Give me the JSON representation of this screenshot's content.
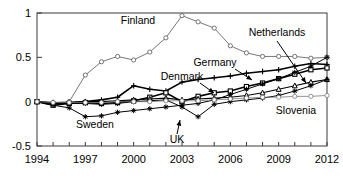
{
  "chart_data": {
    "type": "line",
    "title": "",
    "xlabel": "",
    "ylabel": "",
    "xlim": [
      1994,
      2012
    ],
    "ylim": [
      -0.5,
      1.0
    ],
    "yticks": [
      -0.5,
      0,
      0.5,
      1
    ],
    "ytick_labels": [
      "-0.5",
      "0",
      "0.5",
      "1"
    ],
    "xticks": [
      1994,
      1995,
      1996,
      1997,
      1998,
      1999,
      2000,
      2001,
      2002,
      2003,
      2004,
      2005,
      2006,
      2007,
      2008,
      2009,
      2010,
      2011,
      2012
    ],
    "xtick_labels_shown": [
      "1994",
      "1997",
      "2000",
      "2003",
      "2006",
      "2009",
      "2012"
    ],
    "xtick_label_years": [
      1994,
      1997,
      2000,
      2003,
      2006,
      2009,
      2012
    ],
    "grid": false,
    "legend": "inline-annotations",
    "x": [
      1994,
      1995,
      1996,
      1997,
      1998,
      1999,
      2000,
      2001,
      2002,
      2003,
      2004,
      2005,
      2006,
      2007,
      2008,
      2009,
      2010,
      2011,
      2012
    ],
    "series": [
      {
        "name": "Finland",
        "marker": "circle",
        "color": "#555555",
        "linewidth": 0.8,
        "values": [
          0.0,
          -0.01,
          0.0,
          0.3,
          0.45,
          0.51,
          0.47,
          0.56,
          0.72,
          0.97,
          0.9,
          0.83,
          0.63,
          0.55,
          0.51,
          0.51,
          0.51,
          0.49,
          0.5
        ]
      },
      {
        "name": "Germany",
        "marker": "plus",
        "color": "#000000",
        "linewidth": 1.6,
        "values": [
          0.0,
          -0.02,
          -0.01,
          0.0,
          0.02,
          0.05,
          0.18,
          0.14,
          0.12,
          0.22,
          0.25,
          0.27,
          0.29,
          0.32,
          0.34,
          0.36,
          0.4,
          0.43,
          0.42
        ]
      },
      {
        "name": "Denmark",
        "marker": "square",
        "color": "#000000",
        "linewidth": 1.6,
        "values": [
          0.0,
          -0.04,
          -0.02,
          -0.01,
          -0.02,
          -0.01,
          0.01,
          0.05,
          0.1,
          0.0,
          0.06,
          0.1,
          0.12,
          0.17,
          0.21,
          0.26,
          0.31,
          0.36,
          0.38
        ]
      },
      {
        "name": "Netherlands",
        "marker": "triangle",
        "color": "#000000",
        "linewidth": 1.1,
        "values": [
          0.0,
          -0.01,
          -0.01,
          0.0,
          0.0,
          0.01,
          0.02,
          0.03,
          0.04,
          0.02,
          0.03,
          0.04,
          0.05,
          0.07,
          0.1,
          0.14,
          0.18,
          0.22,
          0.25
        ]
      },
      {
        "name": "Sweden",
        "marker": "star",
        "color": "#000000",
        "linewidth": 1.0,
        "values": [
          0.0,
          -0.04,
          -0.07,
          -0.17,
          -0.16,
          -0.12,
          -0.1,
          -0.08,
          -0.06,
          -0.04,
          -0.02,
          0.02,
          0.08,
          0.14,
          0.2,
          0.26,
          0.33,
          0.4,
          0.5
        ]
      },
      {
        "name": "UK",
        "marker": "star",
        "color": "#000000",
        "linewidth": 1.0,
        "values": [
          0.0,
          -0.02,
          -0.02,
          -0.02,
          -0.03,
          -0.02,
          0.0,
          0.01,
          0.02,
          -0.06,
          -0.17,
          -0.03,
          0.0,
          0.02,
          0.04,
          0.07,
          0.12,
          0.18,
          0.25
        ]
      },
      {
        "name": "Slovenia",
        "marker": "circle",
        "color": "#777777",
        "linewidth": 0.8,
        "values": [
          0.0,
          -0.01,
          -0.01,
          -0.01,
          -0.01,
          0.0,
          0.0,
          0.0,
          0.01,
          0.01,
          0.01,
          0.02,
          0.03,
          0.04,
          0.05,
          0.05,
          0.06,
          0.06,
          0.07
        ]
      }
    ],
    "annotations": [
      {
        "label": "Finland",
        "x": 138,
        "y": 24,
        "anchor": "middle",
        "leader": null
      },
      {
        "label": "Germany",
        "x": 215,
        "y": 66,
        "anchor": "middle",
        "leader": {
          "x1": 235,
          "y1": 69,
          "x2": 252,
          "y2": 80
        }
      },
      {
        "label": "Denmark",
        "x": 182,
        "y": 80,
        "anchor": "middle",
        "leader": {
          "x1": 200,
          "y1": 83,
          "x2": 214,
          "y2": 93
        }
      },
      {
        "label": "Netherlands",
        "x": 277,
        "y": 36,
        "anchor": "middle",
        "leader": {
          "x1": 277,
          "y1": 41,
          "x2": 306,
          "y2": 83
        }
      },
      {
        "label": "Sweden",
        "x": 95,
        "y": 128,
        "anchor": "middle",
        "leader": null
      },
      {
        "label": "UK",
        "x": 177,
        "y": 143,
        "anchor": "middle",
        "leader": {
          "x1": 177,
          "y1": 134,
          "x2": 180,
          "y2": 120
        }
      },
      {
        "label": "Slovenia",
        "x": 296,
        "y": 114,
        "anchor": "middle",
        "leader": null
      }
    ]
  }
}
